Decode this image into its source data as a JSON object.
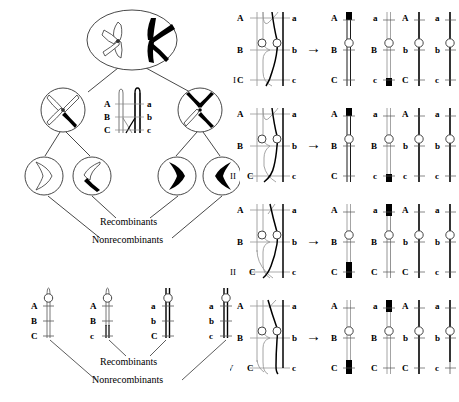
{
  "figure": {
    "colors": {
      "black": "#000000",
      "gray": "#999999",
      "white": "#ffffff",
      "line": "#222222"
    }
  },
  "left_panel": {
    "name": "meiosis-lineage-tree",
    "cells": [
      {
        "id": "parent",
        "label": ""
      },
      {
        "id": "daughter-left",
        "label": ""
      },
      {
        "id": "daughter-right",
        "label": ""
      },
      {
        "id": "gamete-1",
        "label": ""
      },
      {
        "id": "gamete-2",
        "label": ""
      },
      {
        "id": "gamete-3",
        "label": ""
      },
      {
        "id": "gamete-4",
        "label": ""
      }
    ],
    "inset": {
      "name": "crossover-detail-inset",
      "left_labels": [
        "A",
        "B",
        "C"
      ],
      "right_labels": [
        "a",
        "b",
        "c"
      ]
    },
    "annotations": {
      "recombinants": "Recombinants",
      "nonrecombinants": "Nonrecombinants"
    }
  },
  "bottom_panel": {
    "name": "gamete-chromosome-row",
    "chromosomes": [
      {
        "id": "g1",
        "left_labels": [
          "A",
          "B",
          "C"
        ],
        "right_labels": []
      },
      {
        "id": "g2",
        "left_labels": [
          "A",
          "B",
          "c"
        ],
        "right_labels": []
      },
      {
        "id": "g3",
        "left_labels": [
          "a",
          "b",
          "C"
        ],
        "right_labels": []
      },
      {
        "id": "g4",
        "left_labels": [
          "a",
          "b",
          "c"
        ],
        "right_labels": []
      }
    ],
    "annotations": {
      "recombinants": "Recombinants",
      "nonrecombinants": "Nonrecombinants"
    }
  },
  "right_panel": {
    "name": "crossover-cases",
    "arrow": "→",
    "cases": [
      {
        "numeral": "I",
        "input": {
          "left_labels": [
            "A",
            "B",
            "C"
          ],
          "right_labels": [
            "a",
            "b",
            "c"
          ],
          "crossover": "single crossover between A and B on inner chromatids"
        },
        "outputs": [
          {
            "left_label": "A",
            "mid_label": "B",
            "bottom_label": "C",
            "shade": "white"
          },
          {
            "left_label": "a",
            "mid_label": "B",
            "bottom_label": "c",
            "shade": "gray"
          },
          {
            "left_label": "A",
            "mid_label": "b",
            "bottom_label": "C",
            "shade": "black"
          },
          {
            "left_label": "a",
            "mid_label": "b",
            "bottom_label": "c",
            "shade": "black"
          }
        ]
      },
      {
        "numeral": "II",
        "input": {
          "left_labels": [
            "A",
            "B",
            "C"
          ],
          "right_labels": [
            "a",
            "b",
            "c"
          ],
          "crossover": "crossovers above and below centromere"
        },
        "outputs": [
          {
            "left_label": "A",
            "mid_label": "B",
            "bottom_label": "C",
            "shade": "white"
          },
          {
            "left_label": "a",
            "mid_label": "B",
            "bottom_label": "c",
            "shade": "gray"
          },
          {
            "left_label": "A",
            "mid_label": "b",
            "bottom_label": "c",
            "shade": "black"
          },
          {
            "left_label": "a",
            "mid_label": "b",
            "bottom_label": "c",
            "shade": "black"
          }
        ]
      },
      {
        "numeral": "III",
        "input": {
          "left_labels": [
            "A",
            "B",
            "C"
          ],
          "right_labels": [
            "a",
            "b",
            "c"
          ],
          "crossover": "double crossover involving grey chromatid"
        },
        "outputs": [
          {
            "left_label": "A",
            "mid_label": "B",
            "bottom_label": "C",
            "shade": "gray"
          },
          {
            "left_label": "a",
            "mid_label": "B",
            "bottom_label": "C",
            "shade": "white"
          },
          {
            "left_label": "A",
            "mid_label": "b",
            "bottom_label": "C",
            "shade": "black"
          },
          {
            "left_label": "a",
            "mid_label": "b",
            "bottom_label": "c",
            "shade": "black"
          }
        ]
      },
      {
        "numeral": "IV",
        "input": {
          "left_labels": [
            "A",
            "B",
            "C"
          ],
          "right_labels": [
            "a",
            "b",
            "c"
          ],
          "crossover": "crossover low near C locus"
        },
        "outputs": [
          {
            "left_label": "A",
            "mid_label": "B",
            "bottom_label": "C",
            "shade": "gray"
          },
          {
            "left_label": "a",
            "mid_label": "B",
            "bottom_label": "C",
            "shade": "gray"
          },
          {
            "left_label": "A",
            "mid_label": "b",
            "bottom_label": "C",
            "shade": "black"
          },
          {
            "left_label": "a",
            "mid_label": "b",
            "bottom_label": "c",
            "shade": "black"
          }
        ]
      }
    ]
  }
}
